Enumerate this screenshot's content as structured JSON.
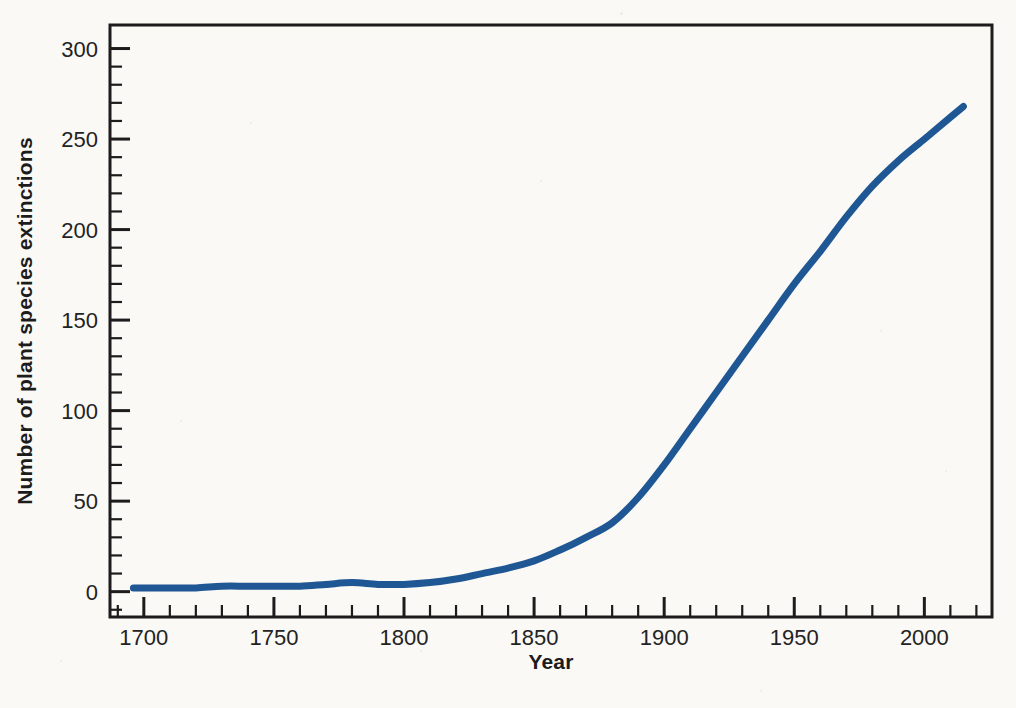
{
  "figure": {
    "background": "#faf9f5",
    "axis_color": "#1c1c1c",
    "text_color": "#232323"
  },
  "chart_data": {
    "type": "line",
    "title": "",
    "xlabel": "Year",
    "ylabel": "Number of plant species extinctions",
    "x_ticks_major": [
      1700,
      1750,
      1800,
      1850,
      1900,
      1950,
      2000
    ],
    "y_ticks_major": [
      0,
      50,
      100,
      150,
      200,
      250,
      300
    ],
    "x_minor": {
      "from": 1690,
      "to": 2020,
      "step": 10
    },
    "y_minor": {
      "from": -10,
      "to": 290,
      "step": 10
    },
    "xlim": [
      1687,
      2026
    ],
    "ylim": [
      -14,
      313
    ],
    "grid": false,
    "legend": null,
    "series": [
      {
        "name": "cumulative-plant-species-extinctions",
        "color": "#1f5795",
        "stroke_width": 7,
        "points": [
          [
            1696,
            2
          ],
          [
            1700,
            2
          ],
          [
            1710,
            2
          ],
          [
            1720,
            2
          ],
          [
            1730,
            3
          ],
          [
            1740,
            3
          ],
          [
            1750,
            3
          ],
          [
            1760,
            3
          ],
          [
            1770,
            4
          ],
          [
            1780,
            5
          ],
          [
            1790,
            4
          ],
          [
            1800,
            4
          ],
          [
            1810,
            5
          ],
          [
            1820,
            7
          ],
          [
            1830,
            10
          ],
          [
            1840,
            13
          ],
          [
            1850,
            17
          ],
          [
            1860,
            23
          ],
          [
            1870,
            30
          ],
          [
            1880,
            38
          ],
          [
            1890,
            52
          ],
          [
            1900,
            70
          ],
          [
            1910,
            90
          ],
          [
            1920,
            110
          ],
          [
            1930,
            130
          ],
          [
            1940,
            150
          ],
          [
            1950,
            170
          ],
          [
            1960,
            188
          ],
          [
            1970,
            207
          ],
          [
            1980,
            224
          ],
          [
            1990,
            238
          ],
          [
            2000,
            250
          ],
          [
            2010,
            262
          ],
          [
            2015,
            268
          ]
        ]
      }
    ]
  }
}
